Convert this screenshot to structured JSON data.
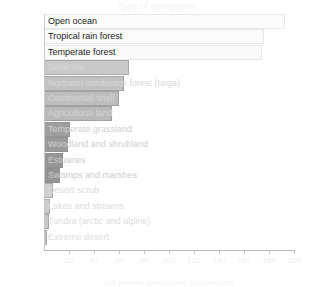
{
  "chart_data": {
    "type": "bar",
    "orientation": "horizontal",
    "title": "Type of ecosystem",
    "xlabel": "Net primary productivity (kilocalories)",
    "ylabel": "",
    "xlim": [
      0,
      200
    ],
    "grid": false,
    "legend": "none",
    "xticks": [
      "20",
      "40",
      "60",
      "80",
      "100",
      "120",
      "140",
      "160",
      "180",
      "200"
    ],
    "categories": [
      "Open ocean",
      "Tropical rain forest",
      "Temperate forest",
      "Savanna",
      "Northern coniferous forest (taiga)",
      "Continental shelf",
      "Agricultural land",
      "Temperate grassland",
      "Woodland and shrubland",
      "Estuaries",
      "Swamps and marshes",
      "Desert scrub",
      "Lakes and streams",
      "Tundra (arctic and alpine)",
      "Extreme desert"
    ],
    "values": [
      193,
      176,
      174,
      68,
      64,
      60,
      54,
      21,
      19,
      15,
      13,
      7,
      5,
      4,
      2
    ],
    "bar_colors": [
      "#fcfcfc",
      "#fbfbfb",
      "#fafafa",
      "#c9c9c9",
      "#c2c2c2",
      "#bdbdbd",
      "#b9b9b9",
      "#9e9e9e",
      "#9a9a9a",
      "#969696",
      "#939393",
      "#cfcfcf",
      "#cbcbcb",
      "#c7c7c7",
      "#c3c3c3"
    ],
    "label_colors": [
      "#1a1a1a",
      "#1a1a1a",
      "#1a1a1a",
      "#d8d8d8",
      "#d8d8d8",
      "#d4d4d4",
      "#d4d4d4",
      "#d0d0d0",
      "#cfcfcf",
      "#cccccc",
      "#cccccc",
      "#dadada",
      "#dcdcdc",
      "#dcdcdc",
      "#dedede"
    ]
  }
}
